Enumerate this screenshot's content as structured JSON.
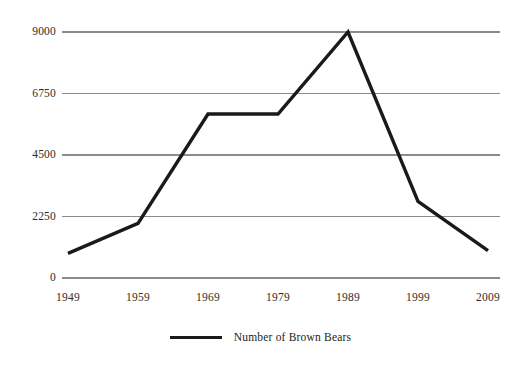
{
  "chart_data": {
    "type": "line",
    "title": "",
    "subtitle": "",
    "xlabel": "",
    "ylabel": "",
    "categories": [
      "1949",
      "1959",
      "1969",
      "1979",
      "1989",
      "1999",
      "2009"
    ],
    "series": [
      {
        "name": "Number of Brown Bears",
        "values": [
          900,
          2000,
          6000,
          6000,
          9000,
          2800,
          1000
        ],
        "color": "#1a1a1a"
      }
    ],
    "x_tick_labels": [
      "1949",
      "1959",
      "1969",
      "1979",
      "1989",
      "1999",
      "2009"
    ],
    "y_tick_labels": [
      "0",
      "2250",
      "4500",
      "6750",
      "9000"
    ],
    "y_tick_values": [
      0,
      2250,
      4500,
      6750,
      9000
    ],
    "ylim": [
      0,
      9000
    ],
    "grid": "horizontal",
    "gridline_color": "#8c8c8c",
    "legend": {
      "position": "bottom-center",
      "entries": [
        {
          "label": "Number of Brown Bears",
          "color": "#1a1a1a"
        }
      ]
    },
    "background_color": "#ffffff",
    "line_color": "#1a1a1a"
  },
  "legend": {
    "series_label": "Number of Brown Bears"
  },
  "axes": {
    "y_labels": [
      "9000",
      "6750",
      "4500",
      "2250",
      "0"
    ],
    "x_labels": [
      "1949",
      "1959",
      "1969",
      "1979",
      "1989",
      "1999",
      "2009"
    ]
  }
}
